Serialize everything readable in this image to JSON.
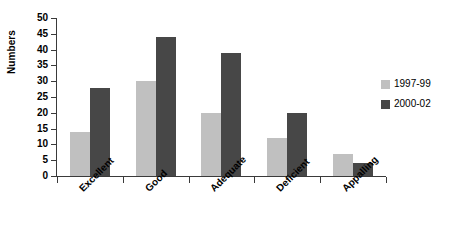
{
  "chart_data": {
    "type": "bar",
    "title": "",
    "subtitle": "",
    "xlabel": "",
    "ylabel": "Numbers",
    "categories": [
      "Excellent",
      "Good",
      "Adequate",
      "Deficient",
      "Appalling"
    ],
    "series": [
      {
        "name": "1997-99",
        "color": "#c0c0c0",
        "values": [
          14,
          30,
          20,
          12,
          7
        ]
      },
      {
        "name": "2000-02",
        "color": "#474747",
        "values": [
          28,
          44,
          39,
          20,
          4
        ]
      }
    ],
    "ylim": [
      0,
      50
    ],
    "ytick_values": [
      0,
      5,
      10,
      15,
      20,
      25,
      30,
      35,
      40,
      45,
      50
    ],
    "ytick_labels": [
      "0",
      "5",
      "10",
      "15",
      "20",
      "25",
      "30",
      "35",
      "40",
      "45",
      "50"
    ],
    "grid": false,
    "legend_position": "right",
    "annotations": []
  },
  "axis": {
    "y_title": "Numbers",
    "ticks": [
      "50",
      "45",
      "40",
      "35",
      "30",
      "25",
      "20",
      "15",
      "10",
      "5",
      "0"
    ]
  },
  "categories": {
    "c0": "Excellent",
    "c1": "Good",
    "c2": "Adequate",
    "c3": "Deficient",
    "c4": "Appalling"
  },
  "legend": {
    "items": [
      {
        "label": "1997-99",
        "color": "#c0c0c0"
      },
      {
        "label": "2000-02",
        "color": "#474747"
      }
    ],
    "item0_label": "1997-99",
    "item1_label": "2000-02"
  }
}
